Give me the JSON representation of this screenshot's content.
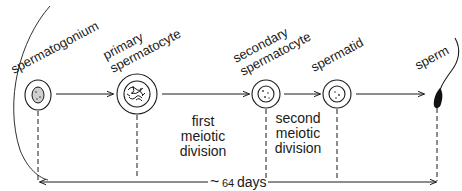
{
  "diagram": {
    "stages": [
      {
        "id": "spermatogonium",
        "label_lines": [
          "spermatogonium"
        ]
      },
      {
        "id": "primary-spermatocyte",
        "label_lines": [
          "primary",
          "spermatocyte"
        ]
      },
      {
        "id": "secondary-spermatocyte",
        "label_lines": [
          "secondary",
          "spermatocyte"
        ]
      },
      {
        "id": "spermatid",
        "label_lines": [
          "spermatid"
        ]
      },
      {
        "id": "sperm",
        "label_lines": [
          "sperm"
        ]
      }
    ],
    "divisions": [
      {
        "id": "first-meiotic-division",
        "label_lines": [
          "first",
          "meiotic",
          "division"
        ]
      },
      {
        "id": "second-meiotic-division",
        "label_lines": [
          "second",
          "meiotic",
          "division"
        ]
      }
    ],
    "duration": {
      "tilde": "~",
      "value": "64",
      "unit": "days"
    },
    "colors": {
      "ink": "#1a1a1a",
      "background": "#ffffff"
    }
  }
}
